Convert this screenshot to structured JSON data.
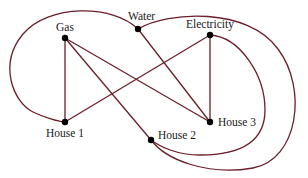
{
  "diagram": {
    "colors": {
      "edge": "#6b1f2a",
      "node": "#000000",
      "label": "#1a1a1a",
      "background": "#ffffff"
    },
    "nodes": [
      {
        "id": "gas",
        "label": "Gas",
        "x": 65,
        "y": 38
      },
      {
        "id": "water",
        "label": "Water",
        "x": 138,
        "y": 29
      },
      {
        "id": "electricity",
        "label": "Electricity",
        "x": 210,
        "y": 35
      },
      {
        "id": "house1",
        "label": "House 1",
        "x": 65,
        "y": 122
      },
      {
        "id": "house2",
        "label": "House 2",
        "x": 151,
        "y": 140
      },
      {
        "id": "house3",
        "label": "House 3",
        "x": 210,
        "y": 122
      }
    ],
    "edges": [
      {
        "from": "gas",
        "to": "house1",
        "shape": "straight"
      },
      {
        "from": "gas",
        "to": "house2",
        "shape": "straight"
      },
      {
        "from": "gas",
        "to": "house3",
        "shape": "straight"
      },
      {
        "from": "water",
        "to": "house3",
        "shape": "straight"
      },
      {
        "from": "water",
        "to": "house1",
        "shape": "curve-left"
      },
      {
        "from": "water",
        "to": "house2",
        "shape": "curve-outer-right"
      },
      {
        "from": "electricity",
        "to": "house1",
        "shape": "straight"
      },
      {
        "from": "electricity",
        "to": "house3",
        "shape": "straight"
      },
      {
        "from": "electricity",
        "to": "house2",
        "shape": "curve-inner-right"
      }
    ]
  }
}
